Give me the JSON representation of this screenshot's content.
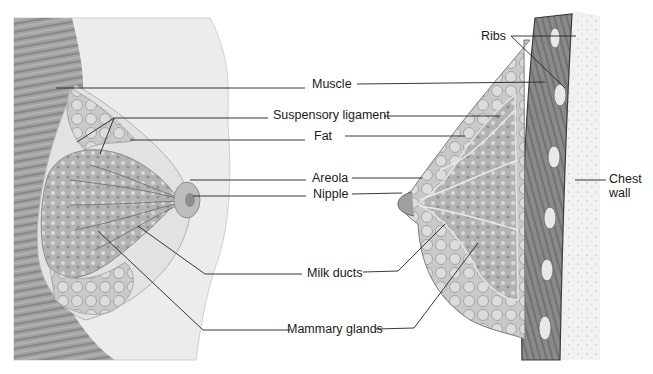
{
  "diagram": {
    "labels": {
      "ribs": "Ribs",
      "muscle": "Muscle",
      "suspensory_ligament": "Suspensory ligament",
      "fat": "Fat",
      "areola": "Areola",
      "nipple": "Nipple",
      "chest_wall_line1": "Chest",
      "chest_wall_line2": "wall",
      "milk_ducts": "Milk ducts",
      "mammary_glands": "Mammary glands"
    },
    "colors": {
      "leader_line": "#222222",
      "tissue_dark": "#7a7a7a",
      "tissue_mid": "#a8a8a8",
      "tissue_light": "#d6d6d6",
      "skin": "#e4e4e4",
      "background": "#ffffff"
    }
  }
}
